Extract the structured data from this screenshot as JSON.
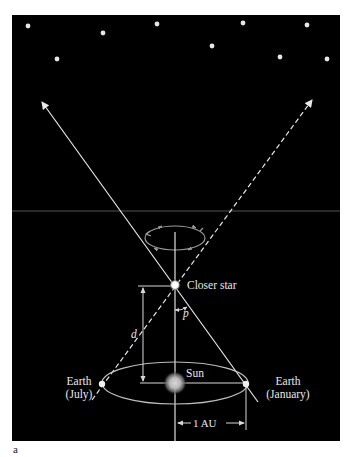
{
  "figure": {
    "panel_letter": "a",
    "background": "#000000",
    "foreground": "#e8e8e8"
  },
  "labels": {
    "closer_star": "Closer star",
    "parallax_angle": "p",
    "distance": "d",
    "sun": "Sun",
    "earth_july_line1": "Earth",
    "earth_july_line2": "(July)",
    "earth_january_line1": "Earth",
    "earth_january_line2": "(January)",
    "au_scale": "1 AU"
  },
  "background_stars": [
    {
      "x": 28,
      "y": 26
    },
    {
      "x": 103,
      "y": 33
    },
    {
      "x": 157,
      "y": 24
    },
    {
      "x": 243,
      "y": 23
    },
    {
      "x": 307,
      "y": 25
    },
    {
      "x": 57,
      "y": 59
    },
    {
      "x": 212,
      "y": 46
    },
    {
      "x": 280,
      "y": 57
    },
    {
      "x": 327,
      "y": 59
    }
  ],
  "geometry": {
    "closer_star": {
      "x": 175,
      "y": 285
    },
    "sun": {
      "x": 175,
      "y": 383
    },
    "earth_july": {
      "x": 102,
      "y": 384
    },
    "earth_january": {
      "x": 246,
      "y": 384
    },
    "orbit": {
      "cx": 175,
      "cy": 383,
      "rx": 73,
      "ry": 21
    },
    "small_orbit": {
      "cx": 175,
      "cy": 238,
      "rx": 30,
      "ry": 12
    },
    "horizon_line_y": 211
  }
}
